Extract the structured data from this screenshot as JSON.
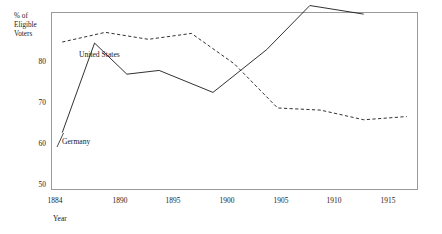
{
  "chart_data": {
    "type": "line",
    "title": "",
    "subtitle": "",
    "xlabel": "Year",
    "ylabel": "% of\nEligible\nVoters",
    "xlim": [
      1883,
      1917
    ],
    "ylim": [
      50,
      83
    ],
    "grid": false,
    "legend_position": "inline-annotations",
    "x_ticks": [
      1884,
      1890,
      1895,
      1900,
      1905,
      1910,
      1915
    ],
    "x_tick_labels": [
      "1884",
      "1890",
      "1895",
      "1900",
      "1905",
      "1910",
      "1915"
    ],
    "y_ticks": [
      50,
      60,
      70,
      80
    ],
    "y_tick_labels": [
      "50",
      "60",
      "70",
      "80"
    ],
    "series": [
      {
        "name": "United States",
        "style": "dashed",
        "color": "#1a1a1a",
        "x": [
          1884,
          1888,
          1892,
          1896,
          1900,
          1904,
          1908,
          1912,
          1916
        ],
        "values": [
          77.5,
          79.3,
          78.0,
          79.1,
          73.4,
          65.2,
          64.8,
          63.0,
          63.6
        ]
      },
      {
        "name": "Germany",
        "style": "solid",
        "color": "#1a1a1a",
        "x": [
          1884,
          1887,
          1890,
          1893,
          1898,
          1903,
          1907,
          1912
        ],
        "values": [
          60.6,
          77.3,
          71.5,
          72.2,
          68.1,
          76.1,
          84.3,
          82.7
        ]
      }
    ],
    "annotations": [
      {
        "text": "United States",
        "x": 1892,
        "y": 80.5
      },
      {
        "text": "Germany",
        "x": 1886,
        "y": 61.5
      }
    ]
  },
  "labels": {
    "series_us": "United States",
    "series_de": "Germany",
    "y_axis_title": "% of\nEligible\nVoters",
    "x_axis_title": "Year",
    "y_0": "50",
    "y_1": "60",
    "y_2": "70",
    "y_3": "80",
    "x_0": "1884",
    "x_1": "1890",
    "x_2": "1895",
    "x_3": "1900",
    "x_4": "1905",
    "x_5": "1910",
    "x_6": "1915"
  },
  "colors": {
    "ink": "#1a1a1a",
    "frame": "#9a9a9a",
    "background": "#ffffff"
  }
}
